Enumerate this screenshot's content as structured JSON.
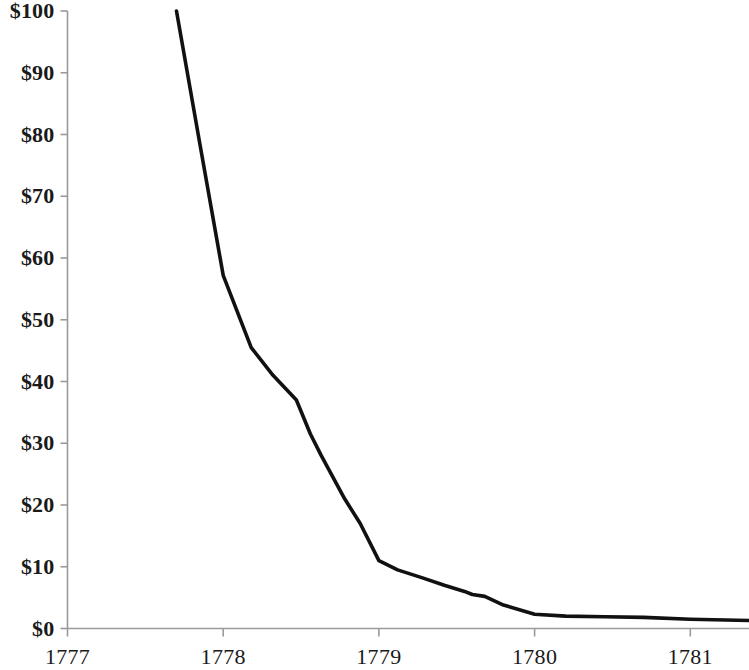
{
  "chart_data": {
    "type": "line",
    "title": "",
    "subtitle": "",
    "xlabel": "",
    "ylabel": "",
    "xlim": [
      1777,
      1781.38
    ],
    "ylim": [
      0,
      100
    ],
    "grid": false,
    "legend": null,
    "y_tick_labels": [
      "$100",
      "$90",
      "$80",
      "$70",
      "$60",
      "$50",
      "$40",
      "$30",
      "$20",
      "$10",
      "$0"
    ],
    "y_ticks": [
      100,
      90,
      80,
      70,
      60,
      50,
      40,
      30,
      20,
      10,
      0
    ],
    "x_tick_labels": [
      "1777",
      "1778",
      "1779",
      "1780",
      "1781"
    ],
    "x_ticks": [
      1777,
      1778,
      1779,
      1780,
      1781
    ],
    "series": [
      {
        "name": "Continental currency value",
        "color": "#111111",
        "x": [
          1777.7,
          1777.85,
          1778.0,
          1778.18,
          1778.32,
          1778.47,
          1778.56,
          1778.63,
          1778.78,
          1778.88,
          1779.0,
          1779.12,
          1779.28,
          1779.42,
          1779.55,
          1779.6,
          1779.68,
          1779.8,
          1780.0,
          1780.2,
          1780.45,
          1780.7,
          1781.0,
          1781.38
        ],
        "y": [
          100.0,
          78.5,
          57.2,
          45.5,
          41.0,
          37.0,
          31.5,
          28.0,
          21.0,
          17.0,
          11.0,
          9.5,
          8.2,
          7.0,
          6.0,
          5.5,
          5.2,
          3.8,
          2.3,
          2.0,
          1.9,
          1.8,
          1.5,
          1.3
        ]
      }
    ]
  },
  "axes": {
    "y_axis_color": "#9a9a9a",
    "x_axis_color": "#9a9a9a",
    "line_color": "#111111"
  }
}
